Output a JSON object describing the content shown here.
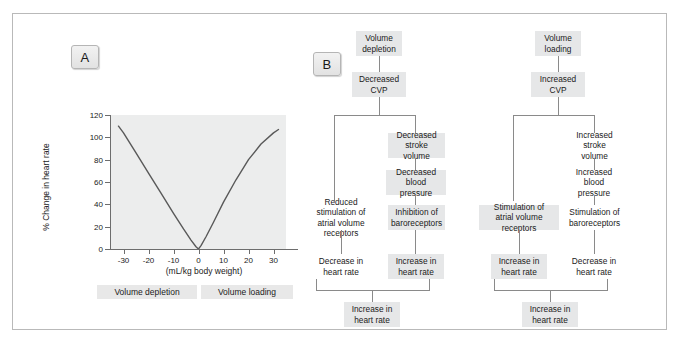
{
  "figure": {
    "panel_a_label": "A",
    "panel_b_label": "B"
  },
  "chart_data": {
    "type": "line",
    "title": "",
    "xlabel": "(mL/kg body weight)",
    "ylabel": "% Change in heart rate",
    "xlim": [
      -35,
      35
    ],
    "ylim": [
      0,
      120
    ],
    "xticks": [
      -30,
      -20,
      -10,
      0,
      10,
      20,
      30
    ],
    "xtick_labels": [
      "-30",
      "-20",
      "-10",
      "0",
      "10",
      "20",
      "30"
    ],
    "yticks": [
      0,
      20,
      40,
      60,
      80,
      100,
      120
    ],
    "ytick_labels": [
      "0",
      "20",
      "40",
      "60",
      "80",
      "100",
      "120"
    ],
    "grid": false,
    "legend": "none",
    "plot_background": "#eceded",
    "line_color": "#595959",
    "series": [
      {
        "name": "% Change in heart rate",
        "x": [
          -32,
          -30,
          -25,
          -20,
          -15,
          -10,
          -6,
          -3,
          -1,
          0,
          1,
          3,
          6,
          10,
          15,
          20,
          25,
          30,
          32
        ],
        "y": [
          110,
          104,
          86,
          68,
          50,
          32,
          18,
          8,
          2,
          0,
          3,
          11,
          24,
          42,
          62,
          80,
          94,
          104,
          107
        ]
      }
    ],
    "range_bars": [
      {
        "label": "Volume depletion",
        "x_from": -35,
        "x_to": 0
      },
      {
        "label": "Volume loading",
        "x_from": 0,
        "x_to": 32
      }
    ]
  },
  "flow_left": {
    "nodes": {
      "start": "Volume\ndepletion",
      "cvp": "Decreased\nCVP",
      "stroke_volume": "Decreased\nstroke volume",
      "blood_pressure": "Decreased\nblood pressure",
      "volume_receptors": "Reduced stimulation of\natrial volume receptors",
      "baroreceptors": "Inhibition of\nbaroreceptors",
      "hr_left": "Decrease in\nheart rate",
      "hr_right": "Increase in\nheart rate",
      "result": "Increase in\nheart rate"
    }
  },
  "flow_right": {
    "nodes": {
      "start": "Volume\nloading",
      "cvp": "Increased\nCVP",
      "stroke_volume": "Increased\nstroke volume",
      "blood_pressure": "Increased\nblood pressure",
      "volume_receptors": "Stimulation of\natrial volume receptors",
      "baroreceptors": "Stimulation of\nbaroreceptors",
      "hr_left": "Increase in\nheart rate",
      "hr_right": "Decrease in\nheart rate",
      "result": "Increase in\nheart rate"
    }
  },
  "colors": {
    "frame_border": "#b9b9b9",
    "node_shade": "#e6e7e8",
    "connector": "#8a8a8a",
    "axis": "#6d6d6d",
    "text": "#1a1a1a"
  }
}
